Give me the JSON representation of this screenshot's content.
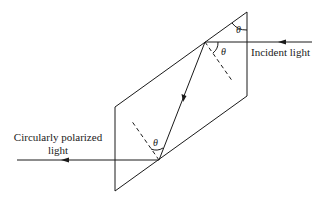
{
  "diagram": {
    "labels": {
      "incident": "Incident light",
      "output_line1": "Circularly polarized",
      "output_line2": "light"
    },
    "angle_symbol": "θ",
    "angle_marks": [
      {
        "name": "apex-angle",
        "label": "θ"
      },
      {
        "name": "upper-incidence-angle",
        "label": "θ"
      },
      {
        "name": "lower-incidence-angle",
        "label": "θ"
      }
    ],
    "colors": {
      "stroke": "#1a1a1a",
      "background": "#ffffff"
    }
  }
}
